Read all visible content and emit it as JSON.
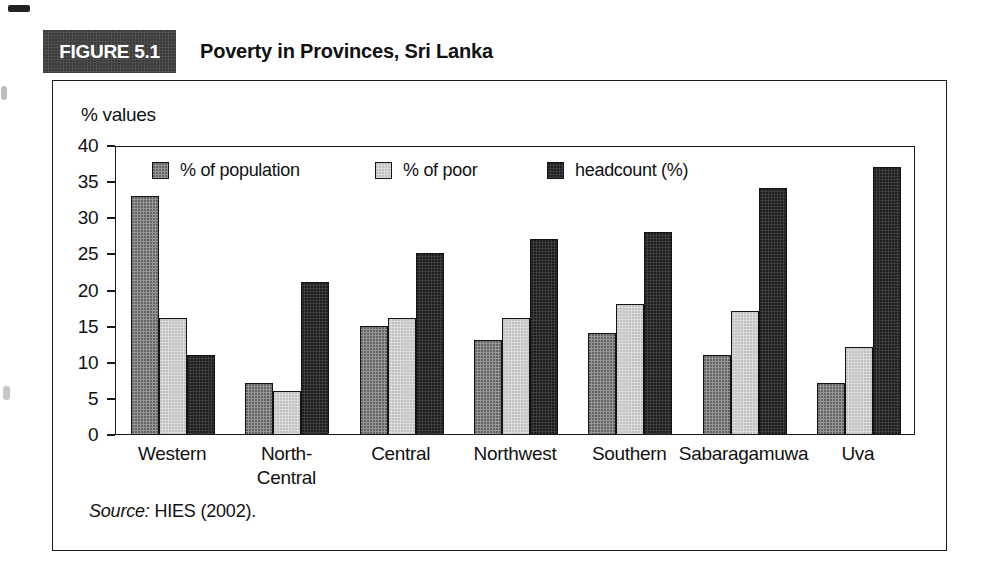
{
  "figure": {
    "label": "FIGURE 5.1",
    "title": "Poverty in Provinces, Sri Lanka",
    "tab_bg": "#4e4e4e"
  },
  "source": {
    "prefix": "Source:",
    "text": " HIES (2002)."
  },
  "chart_data": {
    "type": "bar",
    "title": "Poverty in Provinces, Sri Lanka",
    "ylabel": "% values",
    "xlabel": "",
    "ylim": [
      0,
      40
    ],
    "ytick_step": 5,
    "grid": false,
    "legend_position": "top-inside",
    "categories": [
      "Western",
      "North-\nCentral",
      "Central",
      "Northwest",
      "Southern",
      "Sabaragamuwa",
      "Uva"
    ],
    "series": [
      {
        "name": "% of population",
        "color": "#969696",
        "values": [
          33,
          7,
          15,
          13,
          14,
          11,
          7
        ]
      },
      {
        "name": "% of poor",
        "color": "#dadada",
        "values": [
          16,
          6,
          16,
          16,
          18,
          17,
          12
        ]
      },
      {
        "name": "headcount (%)",
        "color": "#3d3d3d",
        "values": [
          11,
          21,
          25,
          27,
          28,
          34,
          37
        ]
      }
    ],
    "border_color": "#1a1a1a"
  }
}
